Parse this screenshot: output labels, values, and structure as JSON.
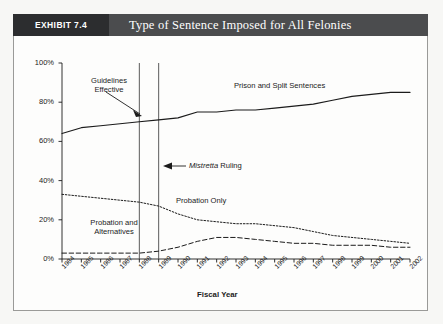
{
  "exhibit": {
    "number_label": "EXHIBIT 7.4",
    "title": "Type of Sentence Imposed for All Felonies"
  },
  "annotations": {
    "guidelines_line1": "Guidelines",
    "guidelines_line2": "Effective",
    "mistretta_italic": "Mistretta",
    "mistretta_rest": " Ruling",
    "prison_label": "Prison and Split Sentences",
    "probation_only_label": "Probation Only",
    "prob_alt_line1": "Probation and",
    "prob_alt_line2": "Alternatives"
  },
  "chart_data": {
    "type": "line",
    "title": "Type of Sentence Imposed for All Felonies",
    "xlabel": "Fiscal Year",
    "ylabel": "",
    "ylim": [
      0,
      100
    ],
    "yticks": [
      "0%",
      "20%",
      "40%",
      "60%",
      "80%",
      "100%"
    ],
    "ytick_values": [
      0,
      20,
      40,
      60,
      80,
      100
    ],
    "grid": false,
    "legend_position": "inline-labels",
    "categories": [
      "1984",
      "1985",
      "1986",
      "1987",
      "1988",
      "1989",
      "1990",
      "1991",
      "1992",
      "1993",
      "1994",
      "1995",
      "1996",
      "1997",
      "1998",
      "1999",
      "2000",
      "2001",
      "2002"
    ],
    "series": [
      {
        "name": "Prison and Split Sentences",
        "style": "solid",
        "color": "#1b1b1b",
        "values": [
          64,
          67,
          68,
          69,
          70,
          71,
          72,
          75,
          75,
          76,
          76,
          77,
          78,
          79,
          81,
          83,
          84,
          85,
          85
        ]
      },
      {
        "name": "Probation Only",
        "style": "dotted",
        "color": "#1b1b1b",
        "values": [
          33,
          32,
          31,
          30,
          29,
          27,
          23,
          20,
          19,
          18,
          18,
          17,
          16,
          14,
          12,
          11,
          10,
          9,
          8
        ]
      },
      {
        "name": "Probation and Alternatives",
        "style": "dashed",
        "color": "#1b1b1b",
        "values": [
          3,
          3,
          3,
          3,
          3,
          4,
          6,
          9,
          11,
          11,
          10,
          9,
          8,
          8,
          7,
          7,
          7,
          6,
          6
        ]
      }
    ],
    "vertical_markers": [
      {
        "label": "Guidelines Effective",
        "year": "1988"
      },
      {
        "label": "Mistretta Ruling",
        "year": "1989"
      }
    ]
  },
  "axis": {
    "x_title": "Fiscal Year"
  }
}
